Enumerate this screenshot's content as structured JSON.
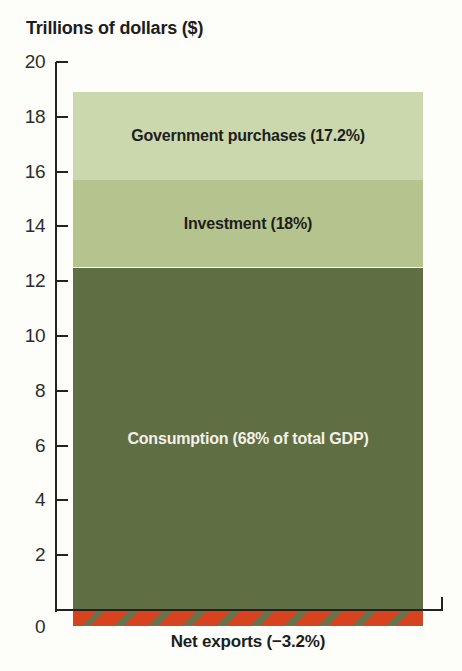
{
  "chart_data": {
    "type": "bar",
    "subtype": "single-stacked-bar",
    "title": "Trillions of dollars ($)",
    "ylabel": "Trillions of dollars ($)",
    "xlabel": "",
    "ylim": [
      0,
      20
    ],
    "yticks": [
      0,
      2,
      4,
      6,
      8,
      10,
      12,
      14,
      16,
      18,
      20
    ],
    "grid": false,
    "legend": "labels-inside-segments",
    "total_gdp_trillions_est": 18.9,
    "segments": [
      {
        "name": "Government purchases",
        "label": "Government purchases (17.2%)",
        "percent_of_gdp": 17.2,
        "value_from_trillions": 15.7,
        "value_to_trillions": 18.9,
        "color": "#cbd8ad",
        "text_color": "#1e1e1c"
      },
      {
        "name": "Investment",
        "label": "Investment (18%)",
        "percent_of_gdp": 18,
        "value_from_trillions": 12.5,
        "value_to_trillions": 15.7,
        "color": "#b5c48e",
        "text_color": "#1e1e1c"
      },
      {
        "name": "Consumption",
        "label": "Consumption (68% of total GDP)",
        "percent_of_gdp": 68,
        "value_from_trillions": 0,
        "value_to_trillions": 12.5,
        "color": "#5f6e43",
        "text_color": "#f3f1e9"
      },
      {
        "name": "Net exports",
        "label": "Net exports (−3.2%)",
        "percent_of_gdp": -3.2,
        "value_from_trillions": -0.6,
        "value_to_trillions": 0,
        "pattern": "diagonal-stripes",
        "stripe_color": "#d8431f",
        "stripe_bg_color": "#68734a",
        "text_color": "#1d1d1d"
      }
    ],
    "colors": {
      "axis": "#222220",
      "tick_label": "#2d2d2b",
      "background": "#fdfdfa"
    }
  }
}
